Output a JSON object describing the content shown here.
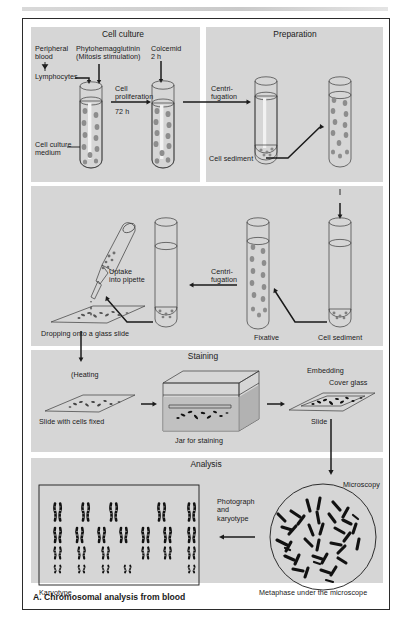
{
  "figure": {
    "caption": "A. Chromosomal analysis from blood"
  },
  "panels": {
    "cell_culture": {
      "title": "Cell culture",
      "labels": {
        "peripheral_blood": "Peripheral\nblood",
        "lymphocytes": "Lymphocytes",
        "pha": "Phytohemagglutinin\n(Mitosis stimulation)",
        "colcemid": "Colcemid\n2 h",
        "cell_proliferation": "Cell\nproliferation",
        "duration": "72 h",
        "medium": "Cell culture\nmedium"
      }
    },
    "preparation": {
      "title": "Preparation",
      "labels": {
        "centrifugation": "Centri-\nfugation",
        "cell_sediment": "Cell sediment",
        "kcl": "Potassium chloride\nhypoosmotic\n20 min",
        "centrifugation2": "Centrifugation"
      }
    },
    "fixation": {
      "labels": {
        "uptake": "Uptake\ninto pipette",
        "dropping": "Dropping onto a glass slide",
        "centrifugation": "Centri-\nfugation",
        "fixative": "Fixative",
        "cell_sediment": "Cell sediment"
      }
    },
    "staining": {
      "title": "Staining",
      "labels": {
        "heating": "(Heating",
        "slide_fixed": "Slide with cells fixed",
        "jar": "Jar for staining",
        "embedding": "Embedding",
        "cover_glass": "Cover glass",
        "slide": "Slide"
      }
    },
    "analysis": {
      "title": "Analysis",
      "labels": {
        "microscopy": "Microscopy",
        "photograph": "Photograph\nand\nkaryotype",
        "karyotype": "Karyotype",
        "metaphase": "Metaphase under the microscope"
      }
    }
  },
  "karyotype": {
    "rows": [
      {
        "groups": 5,
        "height": 17,
        "xs": [
          16,
          44,
          72,
          120,
          150
        ]
      },
      {
        "groups": 7,
        "height": 14,
        "xs": [
          16,
          38,
          60,
          82,
          104,
          126,
          150
        ]
      },
      {
        "groups": 6,
        "height": 11,
        "xs": [
          16,
          40,
          64,
          104,
          126,
          150
        ]
      },
      {
        "groups": 5,
        "height": 7,
        "xs": [
          16,
          40,
          64,
          86,
          150
        ]
      }
    ]
  },
  "colors": {
    "panel_bg": "#d6d6d6",
    "frame": "#2b2b2b",
    "ink": "#1a1a1a",
    "tube_fill": "#c2c2c2",
    "cell": "#8d8d8d"
  }
}
